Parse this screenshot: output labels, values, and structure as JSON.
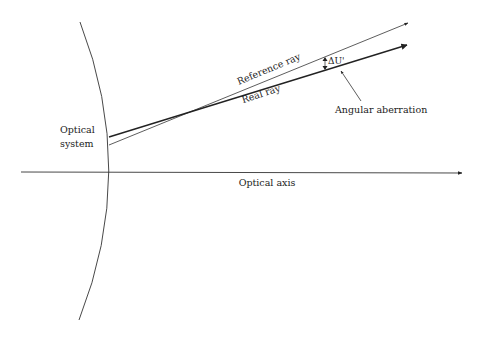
{
  "diagram": {
    "labels": {
      "optical_system_line1": "Optical",
      "optical_system_line2": "system",
      "optical_axis": "Optical axis",
      "reference_ray": "Reference ray",
      "real_ray": "Real ray",
      "delta_u": "ΔU'",
      "angular_aberration": "Angular aberration"
    },
    "colors": {
      "stroke": "#222222",
      "background": "#ffffff"
    }
  }
}
